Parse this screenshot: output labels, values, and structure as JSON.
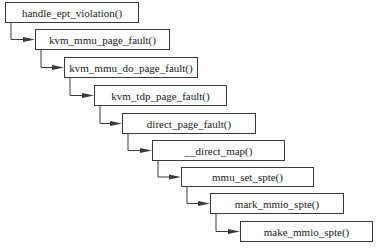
{
  "diagram": {
    "type": "call-chain",
    "nodes": [
      {
        "label": "handle_ept_violation()",
        "x": 5,
        "y": 2,
        "w": 134,
        "h": 21
      },
      {
        "label": "kvm_mmu_page_fault()",
        "x": 35,
        "y": 29,
        "w": 135,
        "h": 21
      },
      {
        "label": "kvm_mmu_do_page_fault()",
        "x": 64,
        "y": 57,
        "w": 134,
        "h": 21
      },
      {
        "label": "kvm_tdp_page_fault()",
        "x": 94,
        "y": 85,
        "w": 133,
        "h": 21
      },
      {
        "label": "direct_page_fault()",
        "x": 122,
        "y": 113,
        "w": 134,
        "h": 21
      },
      {
        "label": "__direct_map()",
        "x": 152,
        "y": 140,
        "w": 133,
        "h": 21
      },
      {
        "label": "mmu_set_spte()",
        "x": 181,
        "y": 167,
        "w": 133,
        "h": 20
      },
      {
        "label": "mark_mmio_spte()",
        "x": 210,
        "y": 193,
        "w": 134,
        "h": 21
      },
      {
        "label": "make_mmio_spte()",
        "x": 240,
        "y": 221,
        "w": 133,
        "h": 21
      }
    ],
    "edges": [
      {
        "from": 0,
        "to": 1
      },
      {
        "from": 1,
        "to": 2
      },
      {
        "from": 2,
        "to": 3
      },
      {
        "from": 3,
        "to": 4
      },
      {
        "from": 4,
        "to": 5
      },
      {
        "from": 5,
        "to": 6
      },
      {
        "from": 6,
        "to": 7
      },
      {
        "from": 7,
        "to": 8
      }
    ],
    "colors": {
      "line": "#3a3a3a",
      "box_border": "#3a3a3a",
      "text": "#1a1a1a"
    }
  }
}
